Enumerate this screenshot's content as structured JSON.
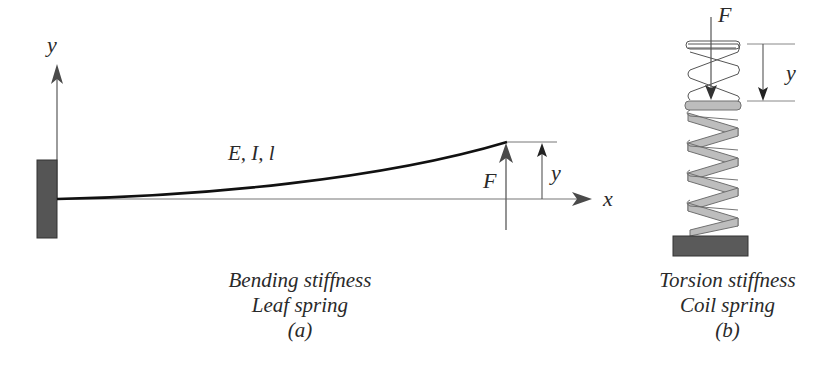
{
  "panel_a": {
    "axis_y_label": "y",
    "axis_x_label": "x",
    "beam_label": "E, I, l",
    "force_label": "F",
    "deflection_label": "y",
    "caption_line1": "Bending stiffness",
    "caption_line2": "Leaf spring",
    "caption_tag": "(a)"
  },
  "panel_b": {
    "force_label": "F",
    "deflection_label": "y",
    "caption_line1": "Torsion stiffness",
    "caption_line2": "Coil spring",
    "caption_tag": "(b)"
  },
  "colors": {
    "ink": "#2a2a2a",
    "axis": "#555555",
    "wall_fill": "#555555",
    "coil_fill": "#bdbdbd",
    "coil_stroke": "#707070",
    "base_fill": "#5a5a5a"
  }
}
